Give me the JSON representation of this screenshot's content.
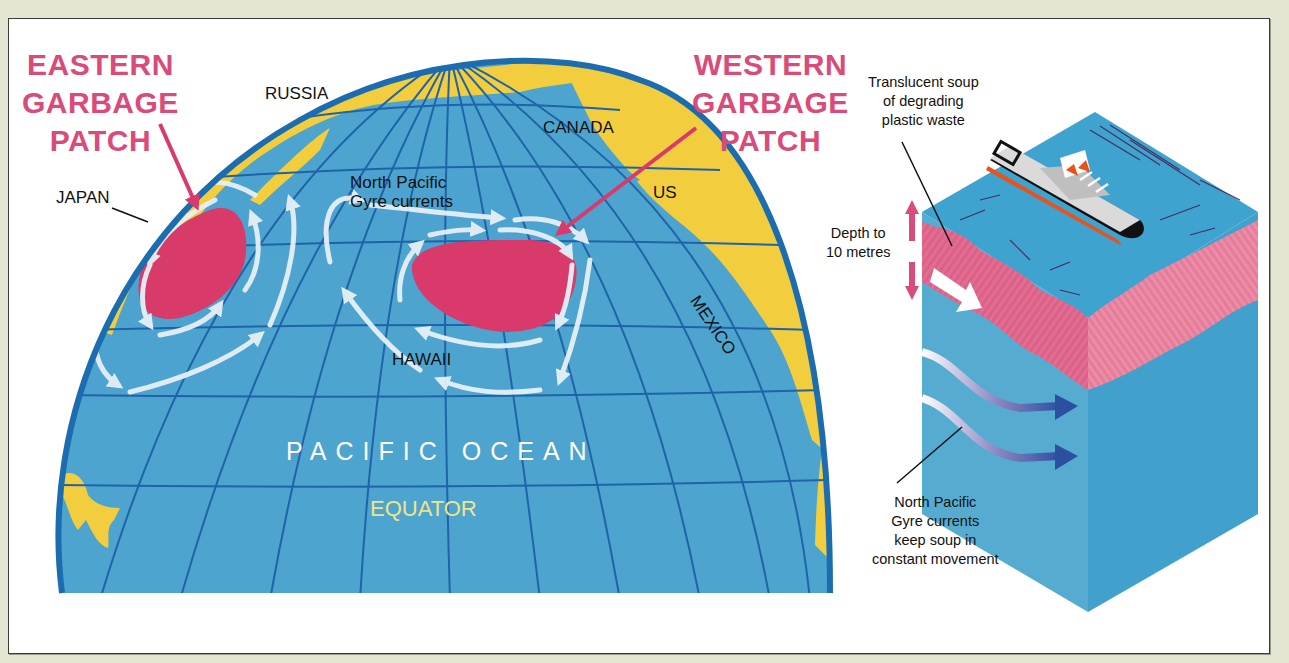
{
  "title_labels": {
    "eastern_patch": [
      "EASTERN",
      "GARBAGE",
      "PATCH"
    ],
    "western_patch": [
      "WESTERN",
      "GARBAGE",
      "PATCH"
    ]
  },
  "map": {
    "places": {
      "russia": "RUSSIA",
      "canada": "CANADA",
      "japan": "JAPAN",
      "us": "US",
      "mexico": "MEXICO",
      "hawaii": "HAWAII"
    },
    "gyre_label": [
      "North Pacific",
      "Gyre currents"
    ],
    "ocean_label": "PACIFIC OCEAN",
    "equator_label": "EQUATOR"
  },
  "cross_section": {
    "soup_label": [
      "Translucent soup",
      "of degrading",
      "plastic waste"
    ],
    "depth_label": [
      "Depth to",
      "10 metres"
    ],
    "currents_label": [
      "North Pacific",
      "Gyre currents",
      "keep soup in",
      "constant movement"
    ]
  },
  "colors": {
    "background": "#e4e5d2",
    "ocean": "#4da4cf",
    "grid": "#1f64a8",
    "land": "#f2cd3e",
    "patch": "#d93a6b",
    "title_pink": "#d94b7a",
    "current_arrow": "#e6f0f6",
    "soup_pink": "#e07394",
    "deep_arrow": "#2d4fa0"
  }
}
